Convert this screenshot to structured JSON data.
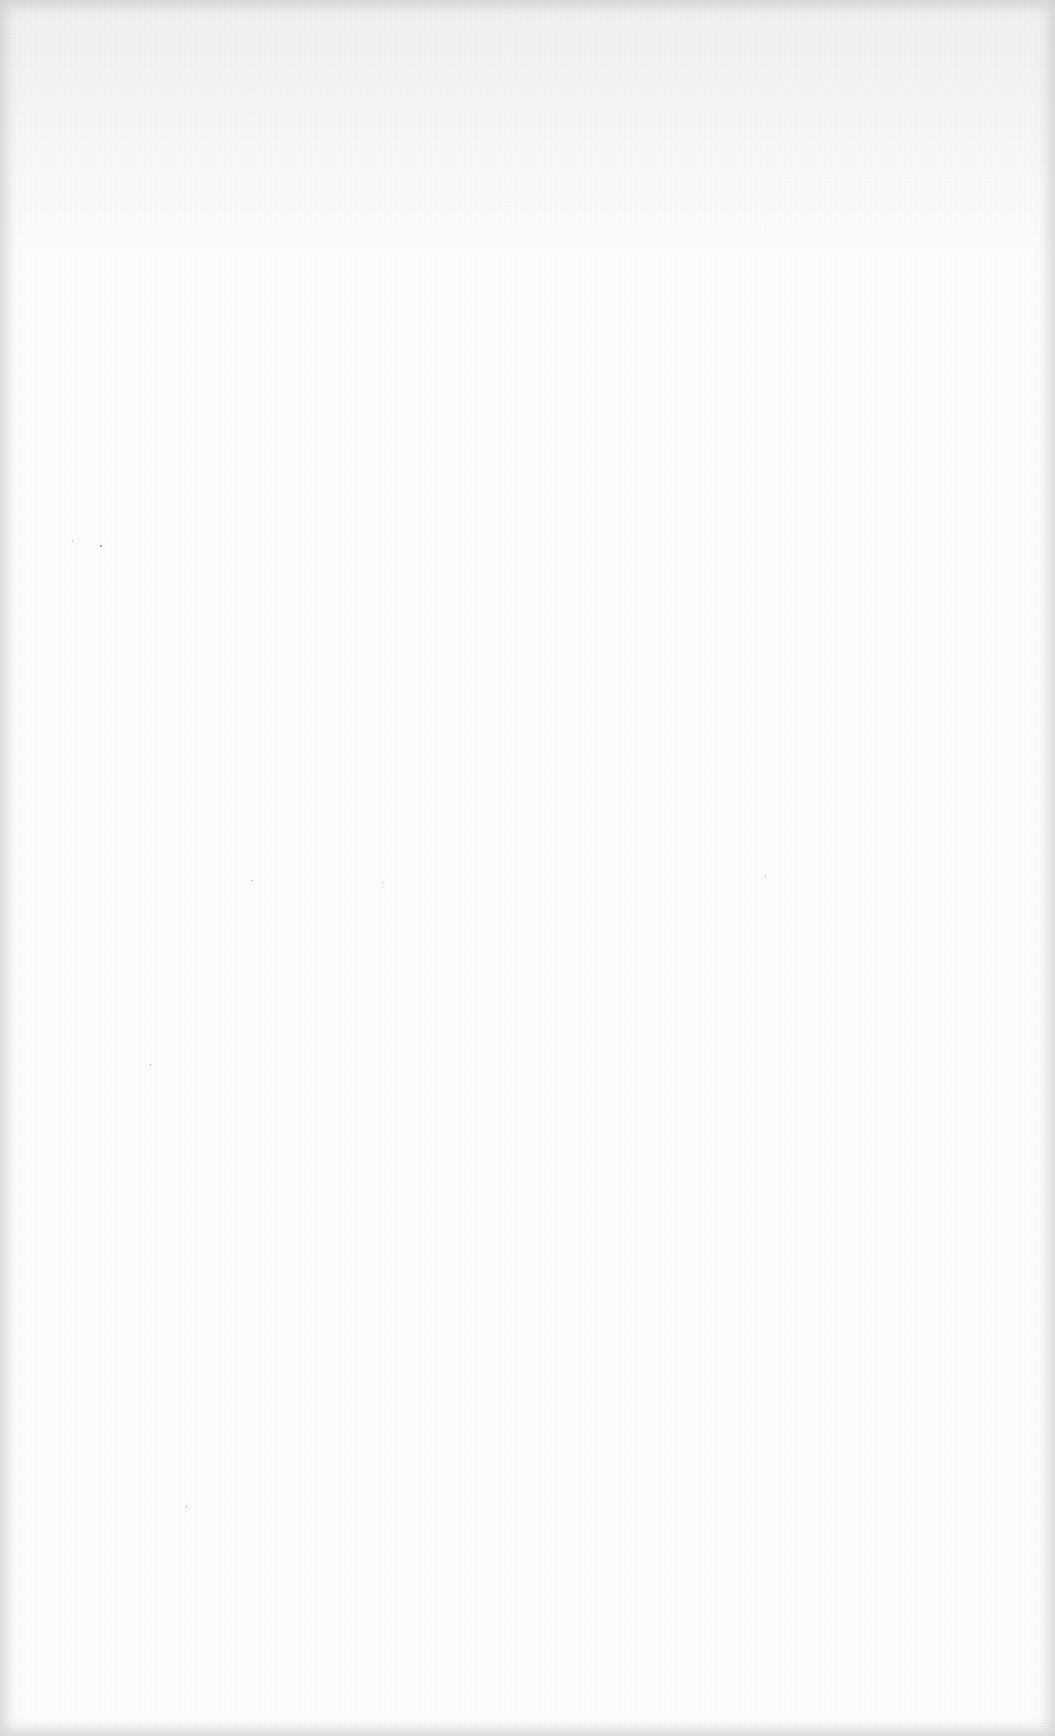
{
  "page": {
    "type": "blank-scanned-page",
    "text": "",
    "background_color": "#fdfdfd",
    "edge_shade_color": "#aaaaaa"
  }
}
